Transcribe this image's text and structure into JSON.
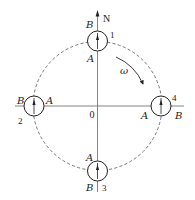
{
  "figure": {
    "axis": {
      "north_label": "N",
      "origin_label": "0"
    },
    "rotation": {
      "label": "ω",
      "direction": "clockwise"
    },
    "positions": [
      {
        "id": "1",
        "number": "1",
        "location": "top",
        "top_label": "B",
        "bottom_label": "A"
      },
      {
        "id": "2",
        "number": "2",
        "location": "left",
        "left_label": "B",
        "right_label": "A"
      },
      {
        "id": "3",
        "number": "3",
        "location": "bottom",
        "top_label": "A",
        "bottom_label": "B"
      },
      {
        "id": "4",
        "number": "4",
        "location": "right",
        "left_label": "A",
        "right_label": "B"
      }
    ],
    "colors": {
      "stroke": "#222222",
      "dashed_orbit": "#555555",
      "axis_line": "#666666"
    }
  }
}
